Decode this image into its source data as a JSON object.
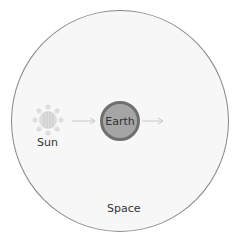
{
  "diagram": {
    "region_label": "Space",
    "sun_label": "Sun",
    "earth_label": "Earth",
    "arrows": [
      {
        "from": "Sun",
        "to": "Earth"
      },
      {
        "from": "Earth",
        "to": "outward"
      }
    ],
    "colors": {
      "space_fill": "#f7f7f7",
      "earth_fill": "#a5a5a5",
      "earth_border": "#6f6f6f",
      "sun": "#d8d8d8",
      "arrow": "#c8c8c8"
    }
  }
}
